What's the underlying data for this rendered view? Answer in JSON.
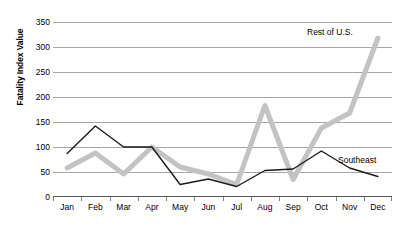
{
  "chart_data": {
    "type": "line",
    "title": "",
    "xlabel": "",
    "ylabel": "Fatality Index Value",
    "categories": [
      "Jan",
      "Feb",
      "Mar",
      "Apr",
      "May",
      "Jun",
      "Jul",
      "Aug",
      "Sep",
      "Oct",
      "Nov",
      "Dec"
    ],
    "ylim": [
      0,
      350
    ],
    "ytick_values": [
      0,
      50,
      100,
      150,
      200,
      250,
      300,
      350
    ],
    "ytick_labels": [
      "0",
      "50",
      "100",
      "150",
      "200",
      "250",
      "300",
      "350"
    ],
    "grid": true,
    "legend_position": "inline-annotations",
    "series": [
      {
        "name": "Southeast",
        "color": "#1a1a1a",
        "line_width": 1.4,
        "values": [
          87,
          142,
          100,
          100,
          25,
          36,
          21,
          53,
          56,
          92,
          58,
          41
        ]
      },
      {
        "name": "Rest of U.S.",
        "color": "#c3c3c3",
        "line_width": 5,
        "values": [
          58,
          88,
          46,
          100,
          60,
          46,
          25,
          183,
          35,
          138,
          168,
          318
        ]
      }
    ],
    "annotations": [
      {
        "text": "Rest of U.S.",
        "series": "Rest of U.S."
      },
      {
        "text": "Southeast",
        "series": "Southeast"
      }
    ]
  },
  "axis": {
    "y_title": "Fatality Index Value"
  },
  "colors": {
    "gridline": "#a6a6a6",
    "axis": "#595959",
    "southeast": "#1a1a1a",
    "rest_of_us": "#c3c3c3",
    "background": "#ffffff"
  }
}
